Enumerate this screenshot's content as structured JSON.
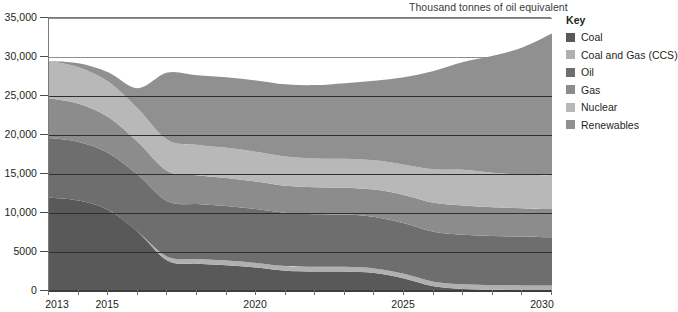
{
  "unit_title": "Thousand tonnes of oil equivalent",
  "legend": {
    "title": "Key",
    "items": [
      {
        "label": "Coal",
        "color": "#595959"
      },
      {
        "label": "Coal and Gas (CCS)",
        "color": "#b0b0b0"
      },
      {
        "label": "Oil",
        "color": "#6e6e6e"
      },
      {
        "label": "Gas",
        "color": "#8c8c8c"
      },
      {
        "label": "Nuclear",
        "color": "#b8b8b8"
      },
      {
        "label": "Renewables",
        "color": "#909090"
      }
    ]
  },
  "caption": "",
  "chart_data": {
    "type": "area",
    "stacked": true,
    "title": "",
    "subtitle": "",
    "xlabel": "",
    "ylabel": "Thousand tonnes of oil equivalent",
    "xlim": [
      2013,
      2030
    ],
    "ylim": [
      0,
      35000
    ],
    "ytick_labels": [
      "0",
      "5000",
      "10,000",
      "15,000",
      "20,000",
      "25,000",
      "30,000",
      "35,000"
    ],
    "ytick_values": [
      0,
      5000,
      10000,
      15000,
      20000,
      25000,
      30000,
      35000
    ],
    "xtick_labels": [
      "2013",
      "2015",
      "2020",
      "2025",
      "2030"
    ],
    "xtick_values": [
      2013,
      2015,
      2020,
      2025,
      2030
    ],
    "x_minor_ticks": [
      2014,
      2016,
      2017,
      2018,
      2019,
      2021,
      2022,
      2023,
      2024,
      2026,
      2027,
      2028,
      2029
    ],
    "grid": "horizontal",
    "legend_position": "right",
    "x": [
      2013,
      2014,
      2015,
      2016,
      2017,
      2018,
      2019,
      2020,
      2021,
      2022,
      2023,
      2024,
      2025,
      2026,
      2027,
      2028,
      2029,
      2030
    ],
    "series": [
      {
        "name": "Coal",
        "color": "#595959",
        "values": [
          12000,
          11600,
          10400,
          7600,
          3900,
          3500,
          3300,
          3000,
          2600,
          2500,
          2500,
          2300,
          1600,
          600,
          250,
          150,
          120,
          100
        ]
      },
      {
        "name": "Coal and Gas (CCS)",
        "color": "#b0b0b0",
        "values": [
          0,
          0,
          0,
          0,
          500,
          600,
          600,
          600,
          600,
          600,
          600,
          600,
          600,
          600,
          600,
          600,
          600,
          600
        ]
      },
      {
        "name": "Oil",
        "color": "#6e6e6e",
        "values": [
          7600,
          7500,
          7300,
          7300,
          7100,
          7050,
          7000,
          6900,
          6800,
          6750,
          6700,
          6600,
          6500,
          6400,
          6350,
          6300,
          6250,
          6200
        ]
      },
      {
        "name": "Gas",
        "color": "#8c8c8c",
        "values": [
          5100,
          4900,
          4600,
          4200,
          3900,
          3700,
          3600,
          3550,
          3500,
          3450,
          3450,
          3500,
          3600,
          3700,
          3750,
          3700,
          3650,
          3600
        ]
      },
      {
        "name": "Nuclear",
        "color": "#b8b8b8",
        "values": [
          4800,
          4700,
          4550,
          4300,
          4000,
          3900,
          3850,
          3800,
          3750,
          3700,
          3700,
          3750,
          3900,
          4300,
          4600,
          4400,
          4300,
          4300
        ]
      },
      {
        "name": "Renewables",
        "color": "#909090",
        "values": [
          0,
          500,
          1200,
          2600,
          8600,
          8900,
          9050,
          9150,
          9250,
          9400,
          9700,
          10200,
          11200,
          12600,
          13800,
          15000,
          16300,
          18200
        ]
      }
    ],
    "totals": [
      29500,
      29200,
      28050,
      26000,
      28000,
      27650,
      27400,
      27000,
      26500,
      26400,
      26650,
      26950,
      27400,
      28200,
      29350,
      30150,
      31220,
      33000
    ]
  }
}
